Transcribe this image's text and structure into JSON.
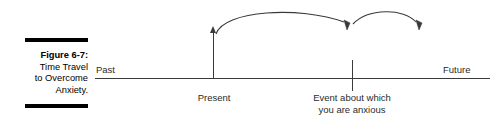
{
  "figure": {
    "caption": {
      "title": "Figure 6-7:",
      "lines": [
        "Time Travel",
        "to Overcome",
        "Anxiety."
      ]
    },
    "timeline": {
      "past_label": "Past",
      "future_label": "Future"
    },
    "markers": [
      {
        "name": "present",
        "label": "Present"
      },
      {
        "name": "event",
        "label_line_1": "Event about which",
        "label_line_2": "you are anxious"
      }
    ],
    "arrows": [
      {
        "name": "present-to-event-arc"
      },
      {
        "name": "event-to-future-arc"
      }
    ],
    "colors": {
      "rule": "#000000",
      "axis": "#3a3a3a",
      "text": "#2b2b2b",
      "background": "#ffffff"
    }
  }
}
